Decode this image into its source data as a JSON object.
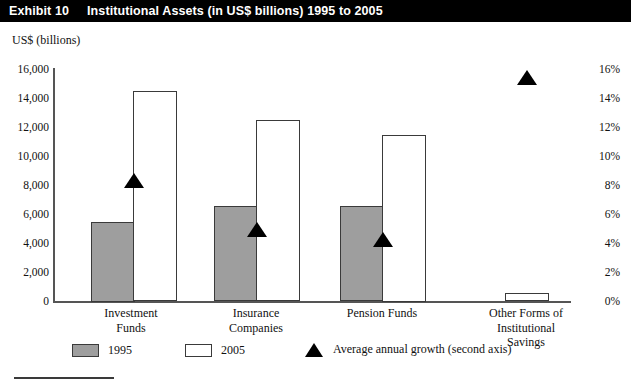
{
  "header": {
    "exhibit_number": "Exhibit 10",
    "exhibit_title": "Institutional Assets (in US$ billions) 1995 to 2005"
  },
  "legend": {
    "items": [
      {
        "label": "1995",
        "swatch": "gray-square",
        "color": "#9e9e9e"
      },
      {
        "label": "2005",
        "swatch": "white-square",
        "color": "#ffffff"
      },
      {
        "label": "Average annual growth (second axis)",
        "swatch": "black-triangle",
        "color": "#000000"
      }
    ]
  },
  "chart_data": {
    "type": "bar",
    "title": "Institutional Assets (in US$ billions) 1995 to 2005",
    "xlabel": "",
    "ylabel": "US$ (billions)",
    "y2label": "",
    "ylim": [
      0,
      16000
    ],
    "y2lim": [
      0,
      16
    ],
    "grid": false,
    "legend_position": "bottom",
    "categories": [
      "Investment Funds",
      "Insurance Companies",
      "Pension Funds",
      "Other Forms of Institutional Savings"
    ],
    "category_lines": [
      [
        "Investment",
        "Funds"
      ],
      [
        "Insurance",
        "Companies"
      ],
      [
        "Pension Funds"
      ],
      [
        "Other Forms of",
        "Institutional",
        "Savings"
      ]
    ],
    "ytick_labels": [
      "16,000",
      "14,000",
      "12,000",
      "10,000",
      "8,000",
      "6,000",
      "4,000",
      "2,000",
      "0"
    ],
    "ytick_values": [
      16000,
      14000,
      12000,
      10000,
      8000,
      6000,
      4000,
      2000,
      0
    ],
    "y2tick_labels": [
      "16%",
      "14%",
      "12%",
      "10%",
      "8%",
      "6%",
      "4%",
      "2%",
      "0%"
    ],
    "y2tick_values": [
      16,
      14,
      12,
      10,
      8,
      6,
      4,
      2,
      0
    ],
    "series": [
      {
        "name": "1995",
        "axis": "left",
        "values": [
          5500,
          6600,
          6600,
          null
        ]
      },
      {
        "name": "2005",
        "axis": "left",
        "values": [
          14600,
          12600,
          11500,
          600
        ]
      },
      {
        "name": "Average annual growth (second axis)",
        "axis": "right",
        "values": [
          8.4,
          5.0,
          4.3,
          15.5
        ]
      }
    ]
  }
}
